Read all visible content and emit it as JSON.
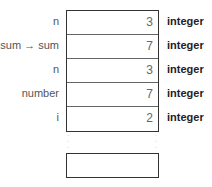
{
  "frames": [
    {
      "name": "n",
      "value": "3",
      "type": "integer"
    },
    {
      "name": "sum → sum",
      "value": "7",
      "type": "integer"
    },
    {
      "name": "n",
      "value": "3",
      "type": "integer"
    },
    {
      "name": "number",
      "value": "7",
      "type": "integer"
    },
    {
      "name": "i",
      "value": "2",
      "type": "integer"
    }
  ],
  "continuation": "·\n·\n·"
}
